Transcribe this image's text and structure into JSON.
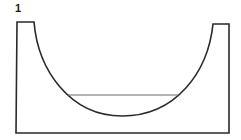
{
  "figure": {
    "label": "1",
    "stroke_color": "#2a2a2a",
    "chord_color": "#6a6a6a"
  }
}
